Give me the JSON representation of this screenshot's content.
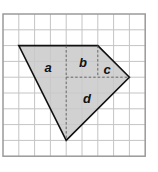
{
  "diagram": {
    "type": "grid-polygon",
    "grid": {
      "columns": 9,
      "rows": 9,
      "origin_px": [
        3,
        14
      ],
      "cell_px": 15.8,
      "line_color": "#c4c4c4",
      "border_color": "#9a9a9a"
    },
    "polygon": {
      "vertices_grid": [
        [
          1,
          2
        ],
        [
          6,
          2
        ],
        [
          8,
          4
        ],
        [
          4,
          8
        ]
      ],
      "fill": "#c9c9c9",
      "stroke": "#111111"
    },
    "dashed_lines": [
      {
        "from": [
          4,
          2
        ],
        "to": [
          4,
          8
        ]
      },
      {
        "from": [
          4,
          4
        ],
        "to": [
          8,
          4
        ]
      },
      {
        "from": [
          6,
          2
        ],
        "to": [
          6,
          4
        ]
      }
    ],
    "regions": [
      {
        "label": "a",
        "pos_px": [
          48,
          72
        ]
      },
      {
        "label": "b",
        "pos_px": [
          83,
          67
        ]
      },
      {
        "label": "c",
        "pos_px": [
          107,
          74
        ]
      },
      {
        "label": "d",
        "pos_px": [
          87,
          103
        ]
      }
    ]
  }
}
